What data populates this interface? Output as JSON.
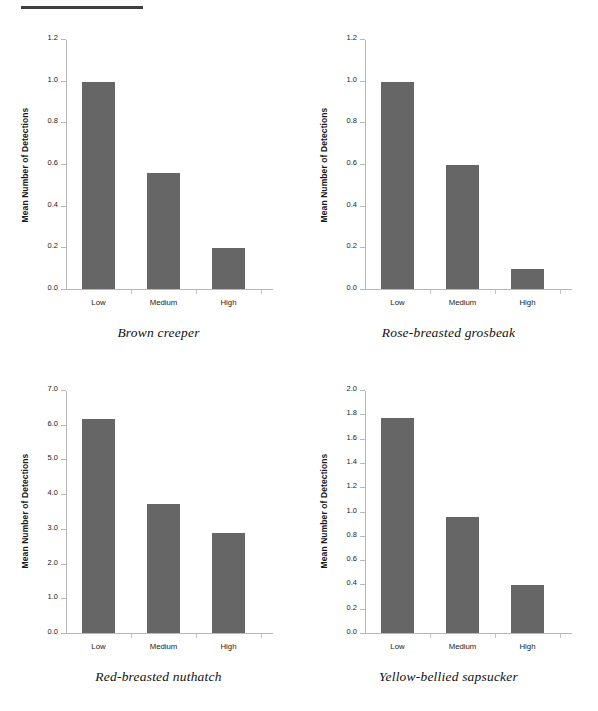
{
  "figure": {
    "top_rule_color": "#404040",
    "bar_color": "#666666",
    "axis_color": "#b8b8b8"
  },
  "chart_data": [
    {
      "type": "bar",
      "title": "Brown creeper",
      "caption": "Brown creeper",
      "xlabel": "",
      "ylabel": "Mean Number of Detections",
      "categories": [
        "Low",
        "Medium",
        "High"
      ],
      "values": [
        1.0,
        0.56,
        0.2
      ],
      "ylim": [
        0.0,
        1.2
      ],
      "ytick_labels": [
        "0.0",
        "0.2",
        "0.4",
        "0.6",
        "0.8",
        "1.0",
        "1.2"
      ],
      "ytick_values": [
        0.0,
        0.2,
        0.4,
        0.6,
        0.8,
        1.0,
        1.2
      ],
      "grid": false,
      "legend": "none"
    },
    {
      "type": "bar",
      "title": "Rose-breasted grosbeak",
      "caption": "Rose-breasted grosbeak",
      "xlabel": "",
      "ylabel": "Mean Number of Detections",
      "categories": [
        "Low",
        "Medium",
        "High"
      ],
      "values": [
        1.0,
        0.6,
        0.1
      ],
      "ylim": [
        0.0,
        1.2
      ],
      "ytick_labels": [
        "0.0",
        "0.2",
        "0.4",
        "0.6",
        "0.8",
        "1.0",
        "1.2"
      ],
      "ytick_values": [
        0.0,
        0.2,
        0.4,
        0.6,
        0.8,
        1.0,
        1.2
      ],
      "grid": false,
      "legend": "none"
    },
    {
      "type": "bar",
      "title": "Red-breasted nuthatch",
      "caption": "Red-breasted nuthatch",
      "xlabel": "",
      "ylabel": "Mean Number of Detections",
      "categories": [
        "Low",
        "Medium",
        "High"
      ],
      "values": [
        6.2,
        3.75,
        2.9
      ],
      "ylim": [
        0.0,
        7.0
      ],
      "ytick_labels": [
        "0.0",
        "1.0",
        "2.0",
        "3.0",
        "4.0",
        "5.0",
        "6.0",
        "7.0"
      ],
      "ytick_values": [
        0.0,
        1.0,
        2.0,
        3.0,
        4.0,
        5.0,
        6.0,
        7.0
      ],
      "grid": false,
      "legend": "none"
    },
    {
      "type": "bar",
      "title": "Yellow-bellied sapsucker",
      "caption": "Yellow-bellied sapsucker",
      "xlabel": "",
      "ylabel": "Mean Number of Detections",
      "categories": [
        "Low",
        "Medium",
        "High"
      ],
      "values": [
        1.78,
        0.96,
        0.4
      ],
      "ylim": [
        0.0,
        2.0
      ],
      "ytick_labels": [
        "0.0",
        "0.2",
        "0.4",
        "0.6",
        "0.8",
        "1.0",
        "1.2",
        "1.4",
        "1.6",
        "1.8",
        "2.0"
      ],
      "ytick_values": [
        0.0,
        0.2,
        0.4,
        0.6,
        0.8,
        1.0,
        1.2,
        1.4,
        1.6,
        1.8,
        2.0
      ],
      "grid": false,
      "legend": "none"
    }
  ]
}
